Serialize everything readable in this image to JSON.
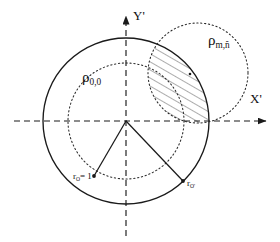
{
  "figure": {
    "name": "overlapping-circles-geometry-diagram",
    "background": "#ffffff",
    "ink": "#1a1a1a",
    "width": 280,
    "height": 242
  },
  "axes": {
    "x": {
      "label": "X'",
      "name": "x-axis",
      "style": "dashed",
      "y": 121,
      "x_start": 14,
      "x_end": 268
    },
    "y": {
      "label": "Y'",
      "name": "y-axis",
      "style": "dashed",
      "x": 126,
      "y_start": 14,
      "y_end": 236
    },
    "origin": {
      "label": "O",
      "x": 126,
      "y": 121
    }
  },
  "circles": [
    {
      "name": "unit-circle-solid",
      "label": "",
      "style": "solid",
      "cx": 126,
      "cy": 121,
      "r": 83,
      "stroke": "#1a1a1a"
    },
    {
      "name": "inner-dotted-circle-rho-0-0",
      "label": "ρ",
      "sublabel": "0,0",
      "style": "dotted",
      "cx": 126,
      "cy": 121,
      "r": 58,
      "stroke": "#1a1a1a"
    },
    {
      "name": "right-dotted-circle-rho-m-n",
      "label": "ρ",
      "sublabel": "m,ñ",
      "style": "dotted",
      "cx": 198,
      "cy": 73,
      "r": 50,
      "stroke": "#1a1a1a"
    }
  ],
  "labels": {
    "rho_00": {
      "glyph": "ρ",
      "sub": "0,0",
      "x": 82,
      "y": 78
    },
    "rho_mn": {
      "glyph": "ρ",
      "sub": "m,ñ",
      "x": 208,
      "y": 40
    },
    "x_axis": {
      "text": "X'",
      "x": 252,
      "y": 100
    },
    "y_axis": {
      "text": "Y'",
      "x": 133,
      "y": 12
    },
    "r_unit": {
      "glyph": "r",
      "sub": "O",
      "suffix": "= 1",
      "x": 78,
      "y": 172
    },
    "r_oprime": {
      "glyph": "r",
      "sub": "O'",
      "x": 187,
      "y": 177
    }
  },
  "radii": [
    {
      "name": "radius-line-r-o-unit",
      "x1": 126,
      "y1": 121,
      "x2": 94,
      "y2": 176,
      "endpoint_dot": true
    },
    {
      "name": "radius-line-r-o-prime",
      "x1": 126,
      "y1": 121,
      "x2": 183,
      "y2": 181,
      "endpoint_dot": true
    }
  ],
  "markers": [
    {
      "name": "center-point-o-prime",
      "x": 190,
      "y": 74,
      "r": 1.3
    }
  ],
  "hatch": {
    "name": "overlap-hatched-region",
    "description": "lens-shaped intersection of the unit circle and the right dotted circle",
    "angle_deg": 60,
    "spacing": 7,
    "stroke": "#3b3b3b"
  }
}
